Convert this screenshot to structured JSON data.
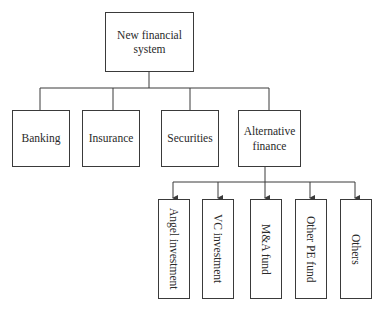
{
  "diagram": {
    "root": {
      "label": "New financial system"
    },
    "level2": [
      {
        "label": "Banking"
      },
      {
        "label": "Insurance"
      },
      {
        "label": "Securities"
      },
      {
        "label": "Alternative finance"
      }
    ],
    "level3_parent": "Alternative finance",
    "level3": [
      {
        "label": "Angel investment"
      },
      {
        "label": "VC investment"
      },
      {
        "label": "M&A fund"
      },
      {
        "label": "Other PE fund"
      },
      {
        "label": "Others"
      }
    ],
    "colors": {
      "line": "#3a3a3a",
      "background": "#ffffff",
      "text": "#2a2a2a"
    }
  }
}
